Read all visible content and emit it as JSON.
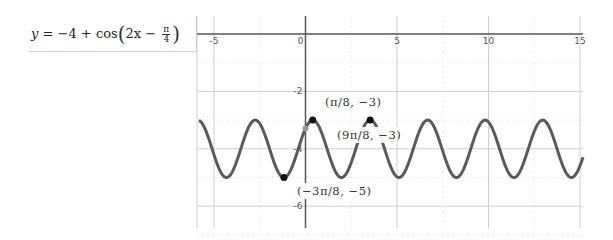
{
  "formula": {
    "lhs": "y",
    "equals": "=",
    "const": "−4",
    "plus": "+",
    "func": "cos",
    "arg_prefix": "2x −",
    "frac_num": "π",
    "frac_den": "4",
    "full_text": "y = −4 + cos(2x − π/4)"
  },
  "colors": {
    "curve": "#5a5a5a",
    "axis": "#555555",
    "major_grid": "#cfcfcf",
    "minor_grid": "#ececec",
    "point": "#111111",
    "intercept_point": "#9a9a9a"
  },
  "chart_data": {
    "type": "line",
    "function": "-4 + cos(2*x - pi/4)",
    "xlabel": "",
    "ylabel": "",
    "xlim": [
      -5.9,
      15.2
    ],
    "ylim": [
      -6.8,
      0.9
    ],
    "x_ticks": [
      -5,
      0,
      5,
      10,
      15
    ],
    "x_tick_labels": [
      "-5",
      "0",
      "5",
      "10",
      "15"
    ],
    "y_ticks": [
      -2,
      -4,
      -6
    ],
    "y_tick_labels": [
      "-2",
      "-4",
      "-6"
    ],
    "grid": true,
    "legend": "none",
    "series": [
      {
        "name": "y = −4 + cos(2x − π/4)",
        "amplitude": 1,
        "midline": -4,
        "period": 3.1416,
        "phase_shift": 0.3927
      }
    ],
    "points": [
      {
        "x": 0.3927,
        "y": -3,
        "label": "(π/8, −3)",
        "kind": "maximum"
      },
      {
        "x": 3.5343,
        "y": -3,
        "label": "(9π/8, −3)",
        "kind": "maximum"
      },
      {
        "x": -1.1781,
        "y": -5,
        "label": "(−3π/8, −5)",
        "kind": "minimum"
      },
      {
        "x": 0,
        "y": -3.2929,
        "label": "",
        "kind": "y-intercept"
      }
    ],
    "annotations": [
      "(π/8, −3)",
      "(9π/8, −3)",
      "(−3π/8, −5)"
    ]
  }
}
